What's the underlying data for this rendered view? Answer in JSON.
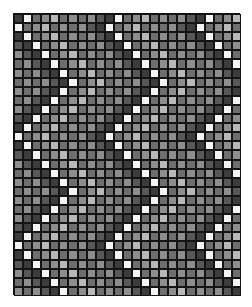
{
  "pattern": {
    "rows": 31,
    "cols": 25,
    "zigzag_period": 12,
    "zigzag_amplitude": 6,
    "stripe_period": 10,
    "palette": {
      "white": "#f4f4f4",
      "light": "#b8b8b8",
      "mid_light": "#8e8e8e",
      "mid": "#6e6e6e",
      "mid_dark": "#585858",
      "dark": "#3c3c3c",
      "darkest": "#2a2a2a"
    },
    "stripe_levels": [
      "white",
      "mid",
      "mid_light",
      "light",
      "mid",
      "mid_light",
      "mid",
      "mid_light",
      "mid_dark",
      "dark"
    ],
    "grid_line_color": "#141414"
  }
}
